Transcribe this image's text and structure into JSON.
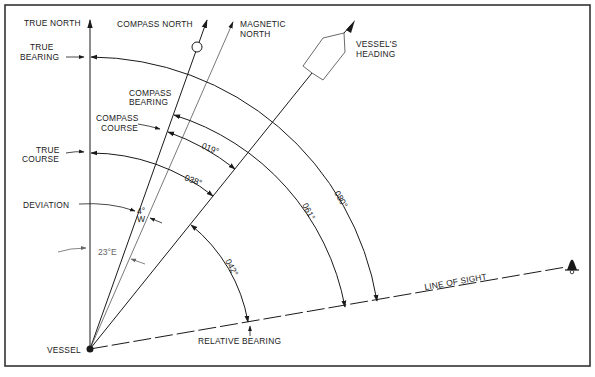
{
  "diagram": {
    "vessel": {
      "x": 90,
      "y": 349,
      "label": "VESSEL"
    },
    "frame": {
      "x": 5,
      "y": 5,
      "w": 585,
      "h": 361
    },
    "directions": {
      "true_north": {
        "label": "TRUE NORTH",
        "angle": 0,
        "length": 329
      },
      "compass_north": {
        "label": "COMPASS NORTH",
        "angle": 19.6,
        "length": 349
      },
      "magnetic_north": {
        "label": "MAGNETIC NORTH",
        "label_lines": [
          "MAGNETIC",
          "NORTH"
        ],
        "angle": 23.6,
        "length": 355
      },
      "vessels_heading": {
        "label": "VESSEL'S HEADING",
        "label_lines": [
          "VESSEL'S",
          "HEADING"
        ],
        "angle": 38.9,
        "length": 420
      },
      "line_of_sight": {
        "label": "LINE OF SIGHT",
        "angle": 80.2,
        "length": 478
      }
    },
    "angles": [
      {
        "name": "true-bearing",
        "label_lines": [
          "TRUE",
          "BEARING"
        ],
        "value": "080°",
        "from": 0,
        "to": 80.2,
        "radius": 292
      },
      {
        "name": "compass-bearing",
        "label_lines": [
          "COMPASS",
          "BEARING"
        ],
        "value": "061°",
        "from": 19.6,
        "to": 80.2,
        "radius": 249
      },
      {
        "name": "compass-course",
        "label_lines": [
          "COMPASS",
          "COURSE"
        ],
        "value": "019°",
        "from": 19.6,
        "to": 38.9,
        "radius": 231
      },
      {
        "name": "true-course",
        "label_lines": [
          "TRUE",
          "COURSE"
        ],
        "value": "038°",
        "from": 0,
        "to": 38.9,
        "radius": 196
      },
      {
        "name": "relative-bearing",
        "label": "RELATIVE BEARING",
        "value": "042°",
        "from": 38.9,
        "to": 80.2,
        "radius": 160
      },
      {
        "name": "deviation",
        "label": "DEVIATION",
        "value": "4°",
        "value_sub": "W",
        "from": 19.6,
        "to": 23.6,
        "radius": 147
      },
      {
        "name": "variation",
        "value": "23°E",
        "from": 0,
        "to": 23.6,
        "radius": 103
      }
    ],
    "colors": {
      "ink": "#1a1a1a",
      "secondary": "#666666",
      "frame": "#333333",
      "background": "#ffffff"
    }
  }
}
